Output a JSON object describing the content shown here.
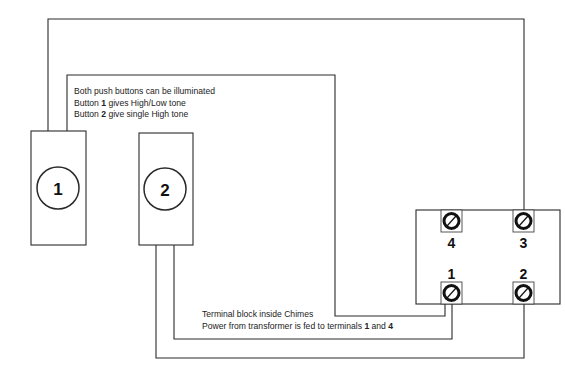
{
  "diagram": {
    "notes_top": [
      {
        "text": "Both push buttons can be illuminated"
      },
      {
        "pre": "Button ",
        "bold": "1",
        "post": " gives High/Low tone"
      },
      {
        "pre": "Button ",
        "bold": "2",
        "post": " give single High tone"
      }
    ],
    "notes_bottom": [
      {
        "text": "Terminal block inside Chimes"
      },
      {
        "pre": "Power from transformer is fed to terminals ",
        "bold": "1",
        "mid": " and ",
        "bold2": "4"
      }
    ],
    "push_buttons": [
      {
        "label": "1"
      },
      {
        "label": "2"
      }
    ],
    "terminal_block": {
      "terminals": [
        {
          "label": "4"
        },
        {
          "label": "3"
        },
        {
          "label": "1"
        },
        {
          "label": "2"
        }
      ]
    },
    "colors": {
      "line": "#2a2a2a",
      "background": "#ffffff"
    }
  }
}
